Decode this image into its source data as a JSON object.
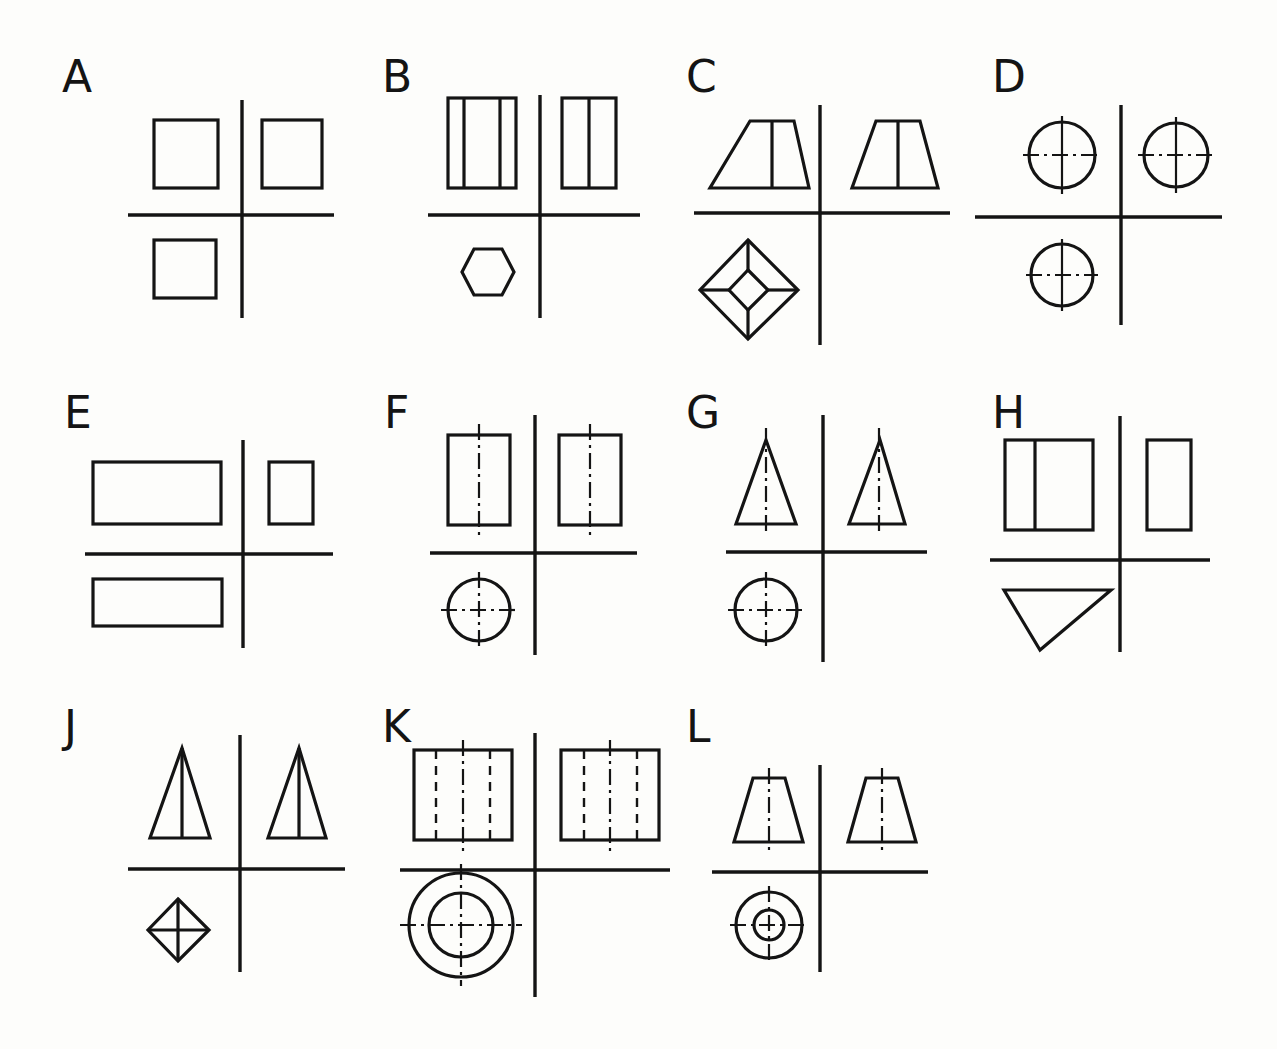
{
  "sheet": {
    "title": "Orthographic Projection Exercise Sheet",
    "description": "Twelve multiview drawing problems, each showing front, side and top/bottom orthographic views of a solid separated by projection axis lines.",
    "background_color": "#fdfdfb",
    "line_color": "#141414",
    "columns": 4,
    "rows": 3,
    "panel_count": 12
  },
  "panels": [
    {
      "id": "A",
      "label": "A",
      "solid": "cube",
      "row": 1,
      "col": 1,
      "views": [
        "square",
        "square",
        "square"
      ],
      "line_types": [
        "visible"
      ]
    },
    {
      "id": "B",
      "label": "B",
      "solid": "hexagonal-prism",
      "row": 1,
      "col": 2,
      "views": [
        "rectangle-with-two-vertical-lines",
        "rectangle-with-one-vertical-line",
        "hexagon"
      ],
      "line_types": [
        "visible"
      ]
    },
    {
      "id": "C",
      "label": "C",
      "solid": "truncated-square-pyramid",
      "row": 1,
      "col": 3,
      "views": [
        "trapezoid-with-center-edge",
        "trapezoid-with-center-edge",
        "diamond-in-diamond"
      ],
      "line_types": [
        "visible"
      ]
    },
    {
      "id": "D",
      "label": "D",
      "solid": "sphere",
      "row": 1,
      "col": 4,
      "views": [
        "circle-with-centerlines",
        "circle-with-centerlines",
        "circle-with-centerlines"
      ],
      "line_types": [
        "visible",
        "center"
      ]
    },
    {
      "id": "E",
      "label": "E",
      "solid": "rectangular-prism",
      "row": 2,
      "col": 1,
      "views": [
        "wide-rectangle",
        "narrow-rectangle",
        "wide-shallow-rectangle"
      ],
      "line_types": [
        "visible"
      ]
    },
    {
      "id": "F",
      "label": "F",
      "solid": "cylinder",
      "row": 2,
      "col": 2,
      "views": [
        "rectangle-with-vertical-centerline",
        "rectangle-with-vertical-centerline",
        "circle-with-centerlines"
      ],
      "line_types": [
        "visible",
        "center"
      ]
    },
    {
      "id": "G",
      "label": "G",
      "solid": "cone",
      "row": 2,
      "col": 3,
      "views": [
        "triangle-with-centerline",
        "narrow-triangle-with-centerline",
        "circle-with-centerlines"
      ],
      "line_types": [
        "visible",
        "center"
      ]
    },
    {
      "id": "H",
      "label": "H",
      "solid": "triangular-prism",
      "row": 2,
      "col": 4,
      "views": [
        "rectangle-with-vertical-edge",
        "rectangle",
        "inverted-triangle"
      ],
      "line_types": [
        "visible"
      ]
    },
    {
      "id": "J",
      "label": "J",
      "solid": "square-pyramid",
      "row": 3,
      "col": 1,
      "views": [
        "triangle-with-center-edge",
        "triangle-with-center-edge",
        "diamond-with-diagonals"
      ],
      "line_types": [
        "visible"
      ]
    },
    {
      "id": "K",
      "label": "K",
      "solid": "hollow-tube",
      "row": 3,
      "col": 2,
      "views": [
        "square-with-hidden-lines",
        "square-with-hidden-lines",
        "concentric-circles-with-centerlines"
      ],
      "line_types": [
        "visible",
        "hidden",
        "center"
      ]
    },
    {
      "id": "L",
      "label": "L",
      "solid": "truncated-cone",
      "row": 3,
      "col": 3,
      "views": [
        "trapezoid-with-centerline",
        "trapezoid-with-centerline",
        "concentric-circles-with-centerlines"
      ],
      "line_types": [
        "visible",
        "center"
      ]
    }
  ],
  "legend": {
    "visible_line": "solid thick",
    "hidden_line": "dashed",
    "center_line": "dash-dot",
    "axis_line": "solid thin projection divider"
  }
}
